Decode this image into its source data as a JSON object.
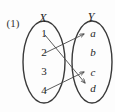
{
  "figure": {
    "number_label": "(1)",
    "type": "mapping-diagram",
    "stroke_color": "#3a3a3a",
    "arrow_color": "#4a4a4a",
    "text_color": "#262626",
    "background": "#fdfdfd",
    "left_set": {
      "title": "X",
      "members": [
        "1",
        "2",
        "3",
        "4"
      ]
    },
    "right_set": {
      "title": "Y",
      "members": [
        "a",
        "b",
        "c",
        "d"
      ]
    },
    "arrows": [
      {
        "from": "1",
        "to": "d"
      },
      {
        "from": "2",
        "to": "a"
      },
      {
        "from": "4",
        "to": "c"
      }
    ],
    "unmapped_left": [
      "3"
    ],
    "unmapped_right": [
      "b"
    ]
  }
}
